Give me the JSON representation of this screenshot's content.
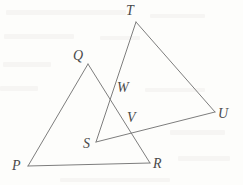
{
  "figure": {
    "background_color": "#fdfdfb",
    "line_color": "#7d7d7d",
    "label_color": "#4a4a4a",
    "canvas": {
      "width": 243,
      "height": 185
    }
  },
  "points": {
    "P": {
      "label": "P",
      "x": 28,
      "y": 166,
      "label_x": 12,
      "label_y": 159
    },
    "Q": {
      "label": "Q",
      "x": 88,
      "y": 64,
      "label_x": 73,
      "label_y": 49
    },
    "R": {
      "label": "R",
      "x": 150,
      "y": 163,
      "label_x": 153,
      "label_y": 157
    },
    "S": {
      "label": "S",
      "x": 96,
      "y": 142,
      "label_x": 83,
      "label_y": 137
    },
    "T": {
      "label": "T",
      "x": 136,
      "y": 22,
      "label_x": 126,
      "label_y": 4
    },
    "U": {
      "label": "U",
      "x": 215,
      "y": 112,
      "label_x": 218,
      "label_y": 107
    },
    "V": {
      "label": "V",
      "x": 131,
      "y": 126,
      "label_x": 127,
      "label_y": 111
    },
    "W": {
      "label": "W",
      "x": 115,
      "y": 89,
      "label_x": 117,
      "label_y": 81
    }
  },
  "segments": [
    {
      "name": "PQ",
      "from": "P",
      "to": "Q"
    },
    {
      "name": "PR",
      "from": "P",
      "to": "R"
    },
    {
      "name": "QR",
      "from": "Q",
      "to": "R"
    },
    {
      "name": "ST",
      "from": "S",
      "to": "T"
    },
    {
      "name": "SU",
      "from": "S",
      "to": "U"
    },
    {
      "name": "TU",
      "from": "T",
      "to": "U"
    }
  ],
  "triangles": [
    {
      "name": "PQR",
      "vertices": [
        "P",
        "Q",
        "R"
      ]
    },
    {
      "name": "STU",
      "vertices": [
        "S",
        "T",
        "U"
      ]
    }
  ],
  "intersections": [
    {
      "label": "W",
      "of": [
        "QR",
        "ST"
      ]
    },
    {
      "label": "V",
      "of": [
        "QR",
        "SU"
      ]
    }
  ]
}
